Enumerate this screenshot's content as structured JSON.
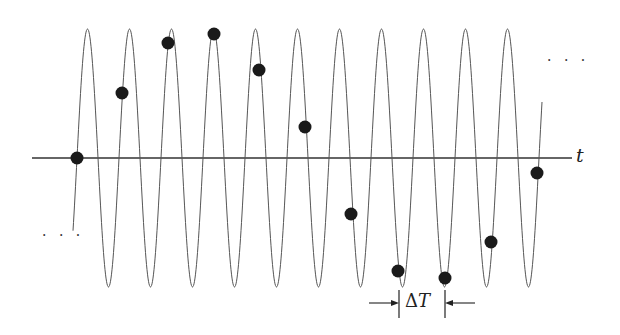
{
  "figure": {
    "type": "sampling-aliasing-diagram",
    "axis_label": "t",
    "interval_label_symbol": "Δ",
    "interval_label_var": "T",
    "continuation_left": "· · ·",
    "continuation_right": "· · ·",
    "colors": {
      "curve": "#555555",
      "axis": "#333333",
      "sample_dot": "#1a1a1a",
      "background": "#ffffff"
    },
    "axis": {
      "x_start": 32,
      "x_end": 572,
      "y": 158
    },
    "wave": {
      "x_start": 73,
      "x_end": 542,
      "zero_crossing_x": 77,
      "period_px": 42,
      "amplitude_px": 129,
      "center_y": 158
    },
    "samples": [
      {
        "x": 77,
        "y": 158
      },
      {
        "x": 122,
        "y": 93
      },
      {
        "x": 168,
        "y": 43
      },
      {
        "x": 214,
        "y": 34
      },
      {
        "x": 259,
        "y": 70
      },
      {
        "x": 305,
        "y": 127
      },
      {
        "x": 351,
        "y": 214
      },
      {
        "x": 398,
        "y": 271
      },
      {
        "x": 445,
        "y": 278
      },
      {
        "x": 491,
        "y": 242
      },
      {
        "x": 537,
        "y": 173
      }
    ],
    "delta_t": {
      "x1": 399,
      "x2": 445,
      "y_top": 290,
      "y_bottom": 318,
      "arrow_y": 303
    }
  }
}
